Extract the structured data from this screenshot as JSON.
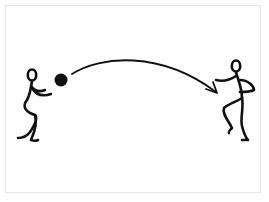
{
  "illustration": {
    "description": "Two stick figures passing a ball; curved arrow shows ball trajectory from left figure to right figure",
    "colors": {
      "ink": "#111111",
      "frame": "#e6e6e6",
      "background": "#ffffff"
    },
    "elements": {
      "thrower": "left stick figure",
      "ball": "black ball",
      "trajectory": "curved arrow",
      "receiver": "right stick figure"
    }
  }
}
